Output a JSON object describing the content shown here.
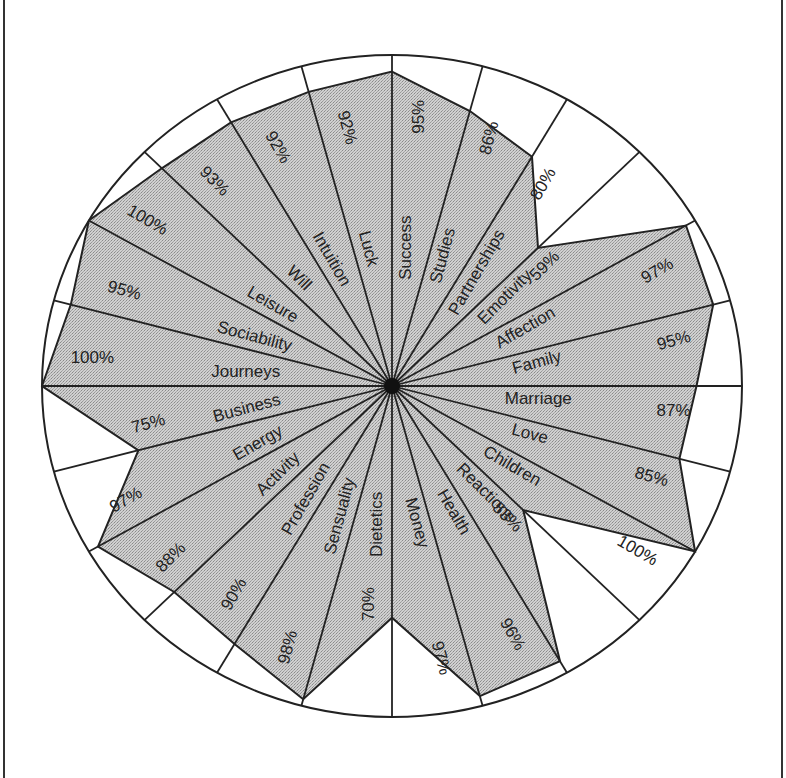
{
  "chart_data": {
    "type": "radar",
    "title": "",
    "orientation": "clockwise from top",
    "start_angle_deg": 90,
    "step_deg": 15,
    "value_unit": "%",
    "max_value": 100,
    "categories": [
      "Success",
      "Studies",
      "Partnerships",
      "Emotivity",
      "Affection",
      "Family",
      "Marriage",
      "Love",
      "Children",
      "Reactions",
      "Health",
      "Money",
      "Dietetics",
      "Sensuality",
      "Profession",
      "Activity",
      "Energy",
      "Business",
      "Journeys",
      "Sociability",
      "Leisure",
      "Will",
      "Intuition",
      "Luck"
    ],
    "values": [
      95,
      86,
      80,
      59,
      97,
      95,
      87,
      85,
      100,
      53,
      96,
      97,
      70,
      98,
      90,
      88,
      97,
      75,
      100,
      95,
      100,
      93,
      92,
      92
    ],
    "value_labels": [
      "95%",
      "86%",
      "80%",
      "59%",
      "97%",
      "95%",
      "87%",
      "85%",
      "100%",
      "53%",
      "96%",
      "97%",
      "70%",
      "98%",
      "90%",
      "88%",
      "97%",
      "75%",
      "100%",
      "95%",
      "100%",
      "93%",
      "92%",
      "92%"
    ],
    "grid": false,
    "legend": "none",
    "fill_pattern": "stippled gray",
    "colors": {
      "fill": "#c4c4c4",
      "line": "#222222",
      "background": "#ffffff"
    }
  }
}
